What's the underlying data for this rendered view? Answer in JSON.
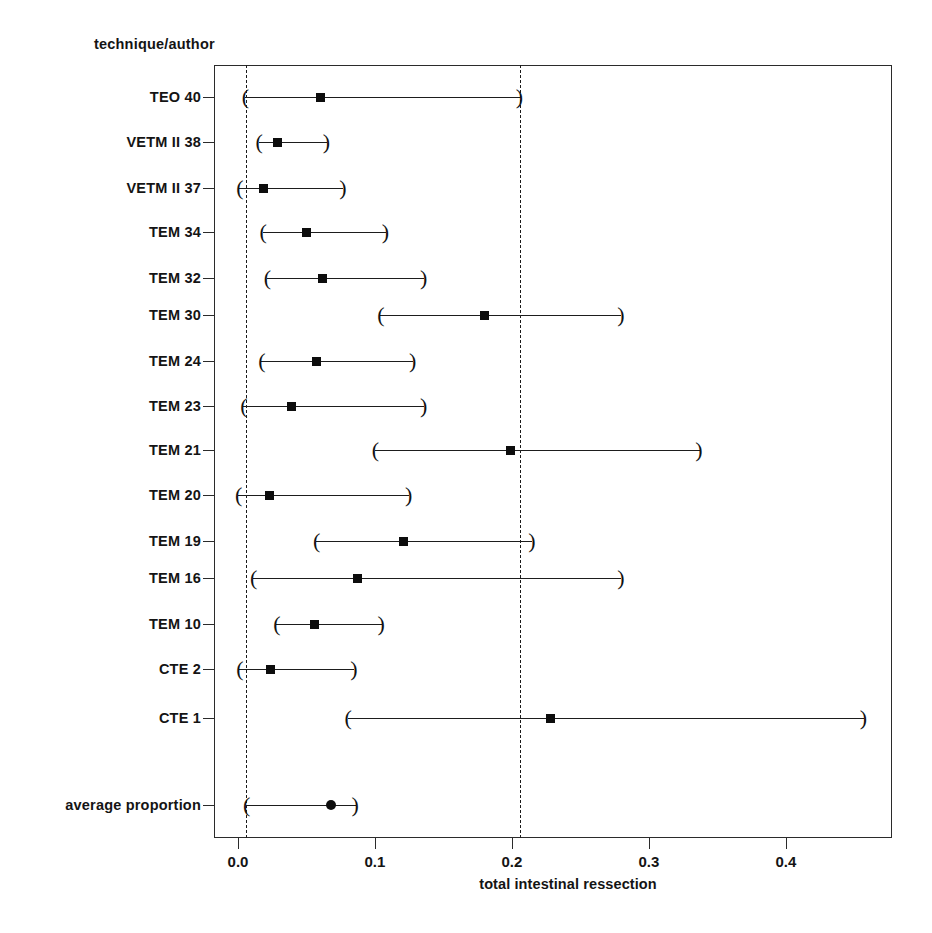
{
  "figure": {
    "type": "forest-plot",
    "y_axis_title": "technique/author",
    "x_axis_title": "total intestinal ressection"
  },
  "chart_data": {
    "type": "scatter",
    "title": "",
    "subtitle": "",
    "xlabel": "total intestinal ressection",
    "ylabel": "technique/author",
    "xlim": [
      -0.0175,
      0.4775
    ],
    "xticks": [
      0.0,
      0.1,
      0.2,
      0.3,
      0.4
    ],
    "xticklabels": [
      "0.0",
      "0.1",
      "0.2",
      "0.3",
      "0.4"
    ],
    "grid": false,
    "legend": "none",
    "reference_lines": [
      0.006,
      0.206
    ],
    "categories": [
      "TEO 40",
      "VETM II 38",
      "VETM II 37",
      "TEM 34",
      "TEM 32",
      "TEM 30",
      "TEM 24",
      "TEM 23",
      "TEM 21",
      "TEM 20",
      "TEM 19",
      "TEM 16",
      "TEM 10",
      "CTE 2",
      "CTE 1",
      "average proportion"
    ],
    "series": [
      {
        "name": "proportion",
        "values": [
          0.06,
          0.029,
          0.019,
          0.05,
          0.062,
          0.18,
          0.057,
          0.039,
          0.199,
          0.023,
          0.121,
          0.087,
          0.056,
          0.024,
          0.228,
          0.068
        ]
      },
      {
        "name": "ci_lower",
        "values": [
          0.005,
          0.015,
          0.001,
          0.018,
          0.021,
          0.104,
          0.017,
          0.004,
          0.1,
          0.0,
          0.057,
          0.011,
          0.028,
          0.001,
          0.08,
          0.006
        ]
      },
      {
        "name": "ci_upper",
        "values": [
          0.206,
          0.065,
          0.077,
          0.108,
          0.136,
          0.28,
          0.128,
          0.136,
          0.337,
          0.125,
          0.215,
          0.28,
          0.105,
          0.085,
          0.457,
          0.086
        ]
      }
    ],
    "rows": [
      {
        "label": "TEO 40",
        "estimate": 0.06,
        "ci_lower": 0.005,
        "ci_upper": 0.206,
        "marker": "square"
      },
      {
        "label": "VETM II 38",
        "estimate": 0.029,
        "ci_lower": 0.015,
        "ci_upper": 0.065,
        "marker": "square"
      },
      {
        "label": "VETM II 37",
        "estimate": 0.019,
        "ci_lower": 0.001,
        "ci_upper": 0.077,
        "marker": "square"
      },
      {
        "label": "TEM 34",
        "estimate": 0.05,
        "ci_lower": 0.018,
        "ci_upper": 0.108,
        "marker": "square"
      },
      {
        "label": "TEM 32",
        "estimate": 0.062,
        "ci_lower": 0.021,
        "ci_upper": 0.136,
        "marker": "square"
      },
      {
        "label": "TEM 30",
        "estimate": 0.18,
        "ci_lower": 0.104,
        "ci_upper": 0.28,
        "marker": "square"
      },
      {
        "label": "TEM 24",
        "estimate": 0.057,
        "ci_lower": 0.017,
        "ci_upper": 0.128,
        "marker": "square"
      },
      {
        "label": "TEM 23",
        "estimate": 0.039,
        "ci_lower": 0.004,
        "ci_upper": 0.136,
        "marker": "square"
      },
      {
        "label": "TEM 21",
        "estimate": 0.199,
        "ci_lower": 0.1,
        "ci_upper": 0.337,
        "marker": "square"
      },
      {
        "label": "TEM 20",
        "estimate": 0.023,
        "ci_lower": 0.0,
        "ci_upper": 0.125,
        "marker": "square"
      },
      {
        "label": "TEM 19",
        "estimate": 0.121,
        "ci_lower": 0.057,
        "ci_upper": 0.215,
        "marker": "square"
      },
      {
        "label": "TEM 16",
        "estimate": 0.087,
        "ci_lower": 0.011,
        "ci_upper": 0.28,
        "marker": "square"
      },
      {
        "label": "TEM 10",
        "estimate": 0.056,
        "ci_lower": 0.028,
        "ci_upper": 0.105,
        "marker": "square"
      },
      {
        "label": "CTE 2",
        "estimate": 0.024,
        "ci_lower": 0.001,
        "ci_upper": 0.085,
        "marker": "square"
      },
      {
        "label": "CTE 1",
        "estimate": 0.228,
        "ci_lower": 0.08,
        "ci_upper": 0.457,
        "marker": "square"
      },
      {
        "label": "average proportion",
        "estimate": 0.068,
        "ci_lower": 0.006,
        "ci_upper": 0.086,
        "marker": "circle"
      }
    ],
    "row_y_fractions": [
      0.0414,
      0.0997,
      0.1592,
      0.2162,
      0.2757,
      0.3236,
      0.383,
      0.4412,
      0.4981,
      0.5563,
      0.6158,
      0.6637,
      0.7232,
      0.7814,
      0.8448,
      0.9573
    ],
    "ci_bracket_glyphs": {
      "lower": "(",
      "upper": ")"
    }
  }
}
